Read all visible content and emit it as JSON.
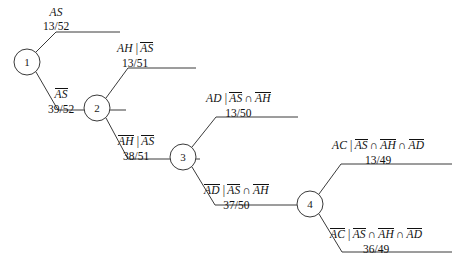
{
  "diagram": {
    "nodes": [
      {
        "id": "node-1",
        "label": "1",
        "cx": 27,
        "cy": 62,
        "r": 13
      },
      {
        "id": "node-2",
        "label": "2",
        "cx": 97,
        "cy": 108,
        "r": 13
      },
      {
        "id": "node-3",
        "label": "3",
        "cx": 183,
        "cy": 157,
        "r": 13
      },
      {
        "id": "node-4",
        "label": "4",
        "cx": 310,
        "cy": 204,
        "r": 13
      }
    ],
    "branches": [
      {
        "id": "branch-as",
        "from": "node-1",
        "direction": "up",
        "event": "AS",
        "event_complement": false,
        "condition": "",
        "probability": "13/52",
        "label_left": 43,
        "label_top": 6
      },
      {
        "id": "branch-as-complement",
        "from": "node-1",
        "direction": "down",
        "event": "AS",
        "event_complement": true,
        "condition": "",
        "probability": "39/52",
        "label_left": 48,
        "label_top": 88
      },
      {
        "id": "branch-ah-given-not-as",
        "from": "node-2",
        "direction": "up",
        "event": "AH",
        "event_complement": false,
        "condition": "AS",
        "probability": "13/51",
        "label_left": 117,
        "label_top": 42
      },
      {
        "id": "branch-not-ah-given-not-as",
        "from": "node-2",
        "direction": "down",
        "event": "AH",
        "event_complement": true,
        "condition": "AS",
        "probability": "38/51",
        "label_left": 118,
        "label_top": 135
      },
      {
        "id": "branch-ad-given-not-as-not-ah",
        "from": "node-3",
        "direction": "up",
        "event": "AD",
        "event_complement": false,
        "condition": "AS ∩ AH",
        "probability": "13/50",
        "label_left": 206,
        "label_top": 92
      },
      {
        "id": "branch-not-ad-given-not-as-not-ah",
        "from": "node-3",
        "direction": "down",
        "event": "AD",
        "event_complement": true,
        "condition": "AS ∩ AH",
        "probability": "37/50",
        "label_left": 204,
        "label_top": 184
      },
      {
        "id": "branch-ac-given-not-as-not-ah-not-ad",
        "from": "node-4",
        "direction": "up",
        "event": "AC",
        "event_complement": false,
        "condition": "AS ∩ AH ∩ AD",
        "probability": "13/49",
        "label_left": 332,
        "label_top": 139
      },
      {
        "id": "branch-not-ac-given-not-as-not-ah-not-ad",
        "from": "node-4",
        "direction": "down",
        "event": "AC",
        "event_complement": true,
        "condition": "AS ∩ AH ∩ AD",
        "probability": "36/49",
        "label_left": 330,
        "label_top": 228
      }
    ],
    "symbols": {
      "conditional_bar": "|",
      "intersection": "∩"
    },
    "colors": {
      "background": "#ffffff",
      "line": "#3a3a3a",
      "text": "#111111"
    }
  }
}
